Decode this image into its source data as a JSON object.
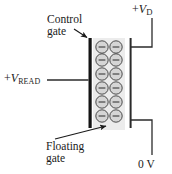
{
  "figure": {
    "background_color": "#ffffff",
    "width": 172,
    "height": 174
  },
  "labels": {
    "control_gate": {
      "line1": "Control",
      "line2": "gate"
    },
    "floating_gate": {
      "line1": "Floating",
      "line2": "gate"
    },
    "v_read": {
      "sign": "+",
      "symbol": "V",
      "subscript": "READ"
    },
    "v_drain": {
      "sign": "+",
      "symbol": "V",
      "subscript": "D"
    },
    "ground": "0 V"
  },
  "colors": {
    "line": "#1a1a1a",
    "electrode": "#141414",
    "floating_gate_fill": "#ececec",
    "electron_fill": "#d5d5d5",
    "electron_stroke": "#3a3a3a",
    "wire": "#2b2b2b"
  },
  "electrons": {
    "symbol": "−",
    "rows": 6,
    "columns": 2,
    "count": 12,
    "radius": 6.2,
    "positions": [
      {
        "cx": 102,
        "cy": 47
      },
      {
        "cx": 116,
        "cy": 47
      },
      {
        "cx": 102,
        "cy": 60
      },
      {
        "cx": 116,
        "cy": 60
      },
      {
        "cx": 102,
        "cy": 74
      },
      {
        "cx": 116,
        "cy": 74
      },
      {
        "cx": 102,
        "cy": 88
      },
      {
        "cx": 116,
        "cy": 88
      },
      {
        "cx": 102,
        "cy": 102
      },
      {
        "cx": 116,
        "cy": 102
      },
      {
        "cx": 102,
        "cy": 116
      },
      {
        "cx": 116,
        "cy": 116
      }
    ]
  },
  "geometry": {
    "control_gate_bar": {
      "x": 89,
      "y_top": 38,
      "y_bottom": 128,
      "width": 3
    },
    "floating_gate_box": {
      "x": 93,
      "y": 38,
      "width": 32,
      "height": 92
    },
    "drain_bar": {
      "x": 130,
      "y_top": 38,
      "y_bottom": 128,
      "width": 2
    },
    "read_wire": {
      "x_start": 47,
      "x_end": 89,
      "y": 80
    },
    "top_stub": {
      "x_start": 130,
      "x_end": 152,
      "y": 47
    },
    "top_riser": {
      "x": 152,
      "y_start": 18,
      "y_end": 47
    },
    "bottom_stub": {
      "x_start": 130,
      "x_end": 152,
      "y": 120
    },
    "bottom_riser": {
      "x": 152,
      "y_start": 120,
      "y_end": 155
    },
    "control_arrow": {
      "x_start": 76,
      "y_start": 31,
      "x_end": 88,
      "y_end": 38
    },
    "floating_arrow": {
      "x_start": 56,
      "y_start": 138,
      "x_end": 105,
      "y_end": 127
    }
  }
}
